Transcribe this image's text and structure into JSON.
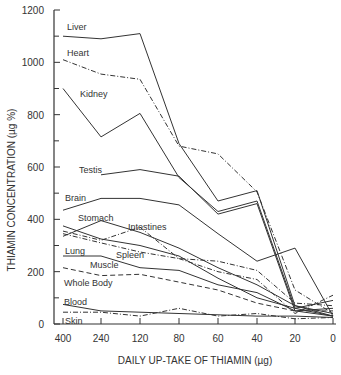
{
  "chart_data": {
    "type": "line",
    "title": "",
    "xlabel": "DAILY UP-TAKE OF THIAMIN (µg)",
    "ylabel": "THIAMIN CONCENTRATION (µg %)",
    "ylim": [
      0,
      1200
    ],
    "y_ticks": [
      0,
      200,
      400,
      600,
      800,
      1000,
      1200
    ],
    "y_minor_ticks": [
      100,
      300,
      500,
      700,
      900,
      1100
    ],
    "categories": [
      "400",
      "240",
      "120",
      "80",
      "60",
      "40",
      "20",
      "0"
    ],
    "grid": false,
    "legend": "inline labels",
    "series": [
      {
        "name": "Liver",
        "style": "solid",
        "values": [
          1100,
          1090,
          1110,
          690,
          470,
          510,
          70,
          30
        ]
      },
      {
        "name": "Heart",
        "style": "dashdot",
        "values": [
          1010,
          955,
          935,
          680,
          650,
          505,
          130,
          40
        ]
      },
      {
        "name": "Kidney",
        "style": "solid",
        "values": [
          900,
          715,
          805,
          560,
          430,
          470,
          60,
          30
        ]
      },
      {
        "name": "Testis",
        "style": "solid",
        "values": [
          null,
          570,
          590,
          565,
          420,
          460,
          50,
          30
        ]
      },
      {
        "name": "Brain",
        "style": "solid",
        "values": [
          435,
          480,
          480,
          455,
          345,
          240,
          290,
          30
        ]
      },
      {
        "name": "Stomach",
        "style": "solid",
        "values": [
          335,
          395,
          350,
          290,
          215,
          150,
          70,
          40
        ]
      },
      {
        "name": "Intestines",
        "style": "dashdot",
        "values": [
          355,
          320,
          370,
          250,
          200,
          170,
          40,
          110
        ]
      },
      {
        "name": "Lung",
        "style": "solid",
        "values": [
          375,
          325,
          300,
          260,
          175,
          100,
          60,
          90
        ]
      },
      {
        "name": "Spleen",
        "style": "dashdot",
        "values": [
          345,
          310,
          275,
          250,
          240,
          205,
          80,
          70
        ]
      },
      {
        "name": "Muscle",
        "style": "solid",
        "values": [
          260,
          260,
          215,
          205,
          150,
          120,
          50,
          60
        ]
      },
      {
        "name": "Whole Body",
        "style": "dashed",
        "values": [
          215,
          185,
          190,
          160,
          130,
          80,
          50,
          50
        ]
      },
      {
        "name": "Blood",
        "style": "solid",
        "values": [
          75,
          50,
          45,
          40,
          35,
          30,
          30,
          25
        ]
      },
      {
        "name": "Skin",
        "style": "dashdot",
        "values": [
          45,
          45,
          30,
          60,
          30,
          40,
          20,
          25
        ]
      }
    ],
    "labels": [
      {
        "text": "Liver",
        "x": 67,
        "y": 30
      },
      {
        "text": "Heart",
        "x": 67,
        "y": 56
      },
      {
        "text": "Kidney",
        "x": 80,
        "y": 97
      },
      {
        "text": "Testis",
        "x": 79,
        "y": 173
      },
      {
        "text": "Brain",
        "x": 65,
        "y": 201
      },
      {
        "text": "Stomach",
        "x": 78,
        "y": 221
      },
      {
        "text": "Intestines",
        "x": 128,
        "y": 230
      },
      {
        "text": "Lung",
        "x": 65,
        "y": 254
      },
      {
        "text": "Spleen",
        "x": 116,
        "y": 258
      },
      {
        "text": "Muscle",
        "x": 90,
        "y": 268
      },
      {
        "text": "Whole Body",
        "x": 64,
        "y": 286
      },
      {
        "text": "Blood",
        "x": 64,
        "y": 305
      },
      {
        "text": "Skin",
        "x": 65,
        "y": 324
      }
    ]
  }
}
